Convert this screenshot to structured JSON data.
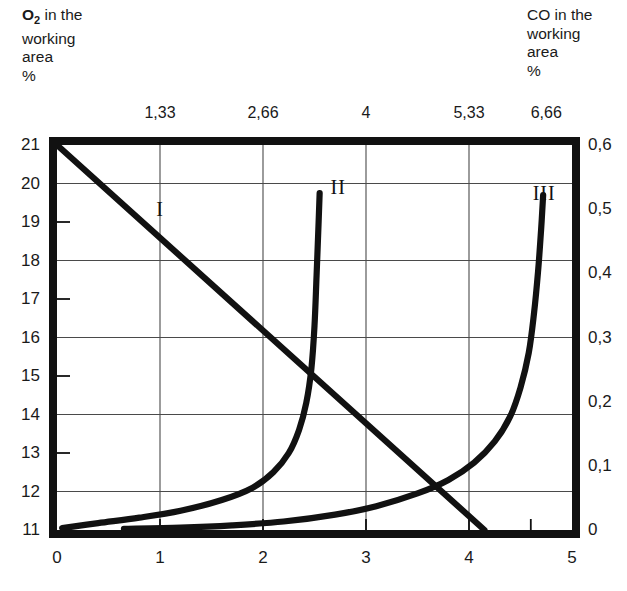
{
  "axis_titles": {
    "left": {
      "species": "O",
      "subscript": "2",
      "rest": " in the\nworking\narea\n%"
    },
    "right": {
      "text": "CO in the\nworking\narea\n%"
    }
  },
  "chart_data": {
    "type": "line",
    "title": "",
    "xlabel": "",
    "ylabel": "",
    "xlim": [
      0,
      5
    ],
    "ylim_left": [
      11,
      21
    ],
    "ylim_right": [
      0,
      0.6
    ],
    "grid": true,
    "legend": "inline-curve-labels",
    "axes": {
      "bottom": {
        "name": "bottom-x-axis",
        "ticks": [
          0,
          1,
          2,
          3,
          4,
          5
        ],
        "ticklabels": [
          "0",
          "1",
          "2",
          "3",
          "4",
          "5"
        ],
        "gridlines_at": [
          1,
          2,
          3,
          4
        ]
      },
      "top": {
        "name": "top-x-axis",
        "ticks": [
          1,
          2,
          3,
          4,
          4.75
        ],
        "ticklabels": [
          "1,33",
          "2,66",
          "4",
          "5,33",
          "6,66"
        ]
      },
      "left": {
        "name": "left-y-axis-o2-percent",
        "ticks": [
          11,
          12,
          13,
          14,
          15,
          16,
          17,
          18,
          19,
          20,
          21
        ],
        "ticklabels": [
          "11",
          "12",
          "13",
          "14",
          "15",
          "16",
          "17",
          "18",
          "19",
          "20",
          "21"
        ],
        "gridlines_at": [
          12,
          14,
          16,
          18,
          20
        ],
        "minor_ticks_at": [
          11,
          13,
          15,
          17,
          19
        ]
      },
      "right": {
        "name": "right-y-axis-co-percent",
        "ticks": [
          0,
          0.1,
          0.2,
          0.3,
          0.4,
          0.5,
          0.6
        ],
        "ticklabels": [
          "0",
          "0,1",
          "0,2",
          "0,3",
          "0,4",
          "0,5",
          "0,6"
        ]
      }
    },
    "series": [
      {
        "name": "I",
        "label": "I",
        "description": "oxygen depletion straight line",
        "axis": "left",
        "label_pos": {
          "x": 1.0,
          "y": 19.35
        },
        "points": [
          [
            0.0,
            21.0
          ],
          [
            4.15,
            11.0
          ]
        ]
      },
      {
        "name": "II",
        "label": "II",
        "description": "carbon monoxide steep exponential rise",
        "axis": "right",
        "label_pos": {
          "x": 2.73,
          "y": 0.535
        },
        "points": [
          [
            0.05,
            11.05
          ],
          [
            0.4,
            11.18
          ],
          [
            0.8,
            11.32
          ],
          [
            1.2,
            11.5
          ],
          [
            1.6,
            11.78
          ],
          [
            1.9,
            12.1
          ],
          [
            2.1,
            12.5
          ],
          [
            2.25,
            13.0
          ],
          [
            2.35,
            13.6
          ],
          [
            2.42,
            14.3
          ],
          [
            2.47,
            15.2
          ],
          [
            2.5,
            16.3
          ],
          [
            2.52,
            17.6
          ],
          [
            2.54,
            19.0
          ],
          [
            2.55,
            19.75
          ]
        ]
      },
      {
        "name": "III",
        "label": "III",
        "description": "carbon monoxide gradual exponential rise",
        "axis": "right",
        "label_pos": {
          "x": 4.73,
          "y": 0.525
        },
        "points": [
          [
            0.65,
            11.03
          ],
          [
            1.2,
            11.06
          ],
          [
            1.7,
            11.12
          ],
          [
            2.2,
            11.22
          ],
          [
            2.7,
            11.4
          ],
          [
            3.1,
            11.62
          ],
          [
            3.5,
            11.95
          ],
          [
            3.8,
            12.3
          ],
          [
            4.05,
            12.75
          ],
          [
            4.25,
            13.3
          ],
          [
            4.4,
            13.95
          ],
          [
            4.5,
            14.7
          ],
          [
            4.58,
            15.6
          ],
          [
            4.63,
            16.6
          ],
          [
            4.67,
            17.7
          ],
          [
            4.7,
            18.8
          ],
          [
            4.72,
            19.7
          ]
        ]
      }
    ],
    "intersections": [
      {
        "curves": [
          "I",
          "II"
        ],
        "x": 2.35,
        "y_left": 15.4
      },
      {
        "curves": [
          "I",
          "III"
        ],
        "x": 3.5,
        "y_left": 13.3
      }
    ]
  }
}
